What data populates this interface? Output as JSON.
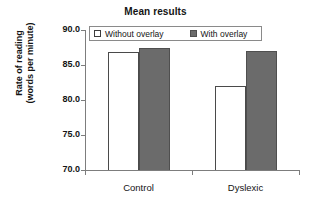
{
  "chart_data": {
    "type": "bar",
    "title": "Mean results",
    "xlabel": "",
    "ylabel": "Rate of reading\n(words per minute)",
    "ylabel_line1": "Rate of reading",
    "ylabel_line2": "(words per minute)",
    "categories": [
      "Control",
      "Dyslexic"
    ],
    "series": [
      {
        "name": "Without overlay",
        "values": [
          86.9,
          82.0
        ],
        "color": "#ffffff",
        "edge_color": "#4a4a4a"
      },
      {
        "name": "With overlay",
        "values": [
          87.4,
          87.0
        ],
        "color": "#6b6b6b",
        "edge_color": "#4f4f4f"
      }
    ],
    "ylim": [
      70.0,
      90.0
    ],
    "yticks": [
      90.0,
      85.0,
      80.0,
      75.0,
      70.0
    ],
    "ytick_labels": [
      "90.0",
      "85.0",
      "80.0",
      "75.0",
      "70.0"
    ],
    "grid": false,
    "legend_position": "top-left-inside",
    "legend_entries": [
      "Without overlay",
      "With overlay"
    ]
  },
  "legend": {
    "items": [
      {
        "label": "Without overlay",
        "swatch": "hollow-square-icon"
      },
      {
        "label": "With overlay",
        "swatch": "filled-square-icon"
      }
    ]
  }
}
